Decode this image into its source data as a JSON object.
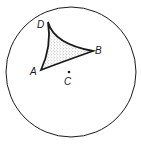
{
  "figure": {
    "colors": {
      "stroke": "#1a1a1a",
      "fill_stipple": "#9a9a9a",
      "background": "#ffffff"
    },
    "disk": {
      "cx": 71,
      "cy": 72,
      "r": 65
    },
    "vertices": {
      "D": {
        "x": 48,
        "y": 22,
        "label": "D"
      },
      "B": {
        "x": 93,
        "y": 51,
        "label": "B"
      },
      "A": {
        "x": 41,
        "y": 70,
        "label": "A"
      }
    },
    "center_point": {
      "x": 69,
      "y": 72,
      "label": "C"
    },
    "labels": {
      "D": "D",
      "B": "B",
      "A": "A",
      "C": "C"
    }
  }
}
